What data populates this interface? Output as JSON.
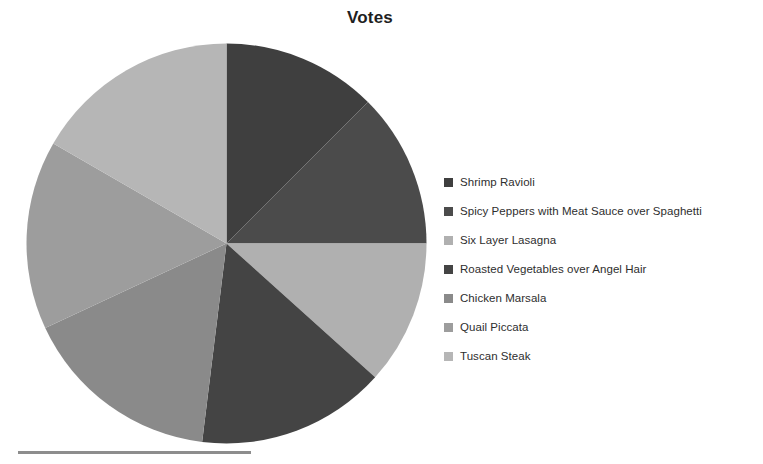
{
  "chart": {
    "title": "Votes"
  },
  "chart_data": {
    "type": "pie",
    "title": "Votes",
    "xlabel": "",
    "ylabel": "",
    "legend_position": "right",
    "grid": false,
    "start_angle_deg": 0,
    "direction": "clockwise",
    "categories": [
      "Shrimp Ravioli",
      "Spicy Peppers with Meat Sauce over Spaghetti",
      "Six Layer Lasagna",
      "Roasted Vegetables over Angel Hair",
      "Chicken Marsala",
      "Quail Piccata",
      "Tuscan Steak"
    ],
    "values": [
      45,
      45,
      42,
      55,
      58,
      55,
      60
    ],
    "units": "degrees",
    "percentages": [
      12.5,
      12.5,
      11.7,
      15.3,
      16.1,
      15.3,
      16.7
    ],
    "colors": [
      "#3f3f3f",
      "#4b4b4b",
      "#b0b0b0",
      "#444444",
      "#8a8a8a",
      "#9d9d9d",
      "#b6b6b6"
    ],
    "slices": [
      {
        "label": "Shrimp Ravioli",
        "angle": 45,
        "color": "#3f3f3f"
      },
      {
        "label": "Spicy Peppers with Meat Sauce over Spaghetti",
        "angle": 45,
        "color": "#4b4b4b"
      },
      {
        "label": "Six Layer Lasagna",
        "angle": 42,
        "color": "#b0b0b0"
      },
      {
        "label": "Roasted Vegetables over Angel Hair",
        "angle": 55,
        "color": "#444444"
      },
      {
        "label": "Chicken Marsala",
        "angle": 58,
        "color": "#8a8a8a"
      },
      {
        "label": "Quail Piccata",
        "angle": 55,
        "color": "#9d9d9d"
      },
      {
        "label": "Tuscan Steak",
        "angle": 60,
        "color": "#b6b6b6"
      }
    ]
  },
  "legend": {
    "items": [
      {
        "label": "Shrimp Ravioli",
        "color": "#3f3f3f"
      },
      {
        "label": "Spicy Peppers with Meat Sauce over Spaghetti",
        "color": "#4b4b4b"
      },
      {
        "label": "Six Layer Lasagna",
        "color": "#b0b0b0"
      },
      {
        "label": "Roasted Vegetables over Angel Hair",
        "color": "#444444"
      },
      {
        "label": "Chicken Marsala",
        "color": "#8a8a8a"
      },
      {
        "label": "Quail Piccata",
        "color": "#9d9d9d"
      },
      {
        "label": "Tuscan Steak",
        "color": "#b6b6b6"
      }
    ]
  },
  "decoration": {
    "rule_color": "#8d8d8d"
  }
}
